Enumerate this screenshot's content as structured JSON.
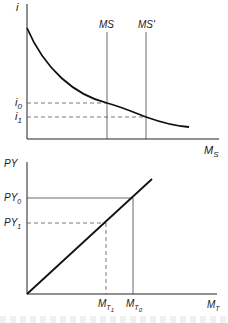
{
  "top_panel": {
    "y_axis_label": "i",
    "x_axis_label": "M",
    "x_axis_sub": "S",
    "curve": "money demand (downward sloping)",
    "vertical_lines": [
      {
        "label": "MS",
        "x": 107
      },
      {
        "label": "MS'",
        "x": 146
      }
    ],
    "levels": [
      {
        "label": "i",
        "sub": "0",
        "y": 103
      },
      {
        "label": "i",
        "sub": "1",
        "y": 117
      }
    ]
  },
  "bottom_panel": {
    "y_axis_label": "PY",
    "x_axis_label": "M",
    "x_axis_sub": "T",
    "curve": "linear from origin",
    "levels": [
      {
        "label": "PY",
        "sub": "0",
        "y": 198,
        "style": "solid"
      },
      {
        "label": "PY",
        "sub": "1",
        "y": 223,
        "style": "dashed"
      }
    ],
    "x_marks": [
      {
        "label": "M",
        "sub": "T",
        "subsub": "1",
        "x": 106,
        "style": "dashed"
      },
      {
        "label": "M",
        "sub": "T",
        "subsub": "0",
        "x": 133,
        "style": "solid"
      }
    ]
  }
}
